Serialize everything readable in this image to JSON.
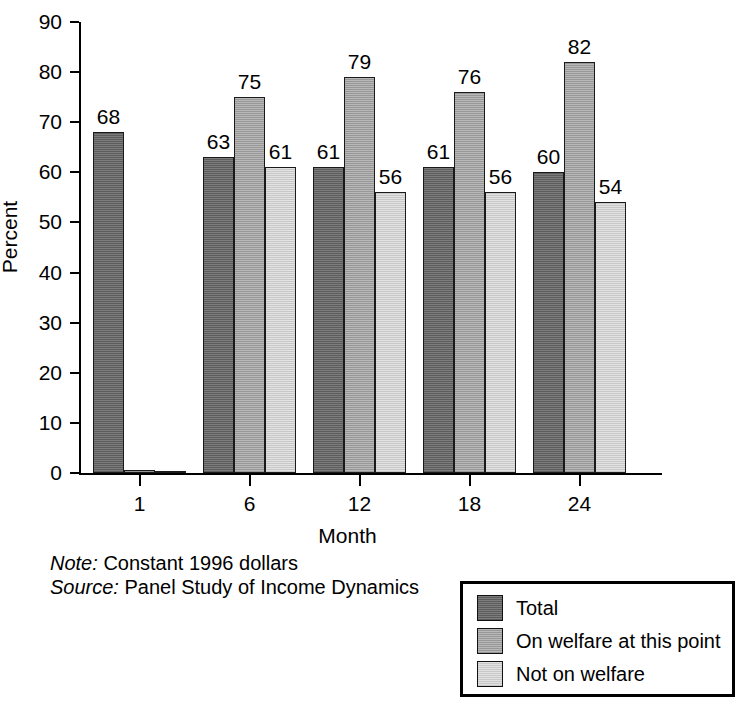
{
  "chart_data": {
    "type": "bar",
    "title": "",
    "xlabel": "Month",
    "ylabel": "Percent",
    "categories": [
      "1",
      "6",
      "12",
      "18",
      "24"
    ],
    "ylim": [
      0,
      90
    ],
    "yticks": [
      0,
      10,
      20,
      30,
      40,
      50,
      60,
      70,
      80,
      90
    ],
    "grid": false,
    "legend_position": "bottom-right",
    "series": [
      {
        "name": "Total",
        "color": "#6e6e6e",
        "values": [
          68,
          63,
          61,
          61,
          60
        ],
        "labels": [
          "68",
          "63",
          "61",
          "61",
          "60"
        ]
      },
      {
        "name": "On welfare at this point",
        "color": "#adadad",
        "values": [
          0.6,
          75,
          79,
          76,
          82
        ],
        "labels": [
          "",
          "75",
          "79",
          "76",
          "82"
        ]
      },
      {
        "name": "Not on welfare",
        "color": "#dcdcdc",
        "values": [
          0,
          61,
          56,
          56,
          54
        ],
        "labels": [
          "",
          "61",
          "56",
          "56",
          "54"
        ]
      }
    ],
    "annotations": {
      "note_label": "Note:",
      "note_text": "Constant 1996 dollars",
      "source_label": "Source:",
      "source_text": "Panel Study of Income Dynamics"
    }
  }
}
